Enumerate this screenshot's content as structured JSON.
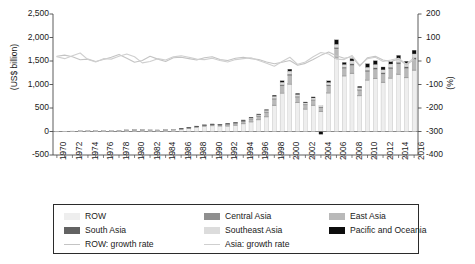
{
  "chart_data": {
    "type": "bar",
    "title": "",
    "subtitle": "",
    "xlabel": "",
    "ylabel": "(US$ billion)",
    "ylabel_right": "(%)",
    "ylim": [
      -500,
      2500
    ],
    "ylim_right": [
      -400,
      200
    ],
    "yticks": [
      "2,500",
      "2,000",
      "1,500",
      "1,000",
      "500",
      "0",
      "-500"
    ],
    "ytick_values": [
      2500,
      2000,
      1500,
      1000,
      500,
      0,
      -500
    ],
    "yticks_right": [
      "200",
      "100",
      "0",
      "-100",
      "-200",
      "-300",
      "-400"
    ],
    "ytick_values_right": [
      200,
      100,
      0,
      -100,
      -200,
      -300,
      -400
    ],
    "grid": false,
    "legend_position": "below",
    "bar_mode": "stacked",
    "x": [
      1970,
      1971,
      1972,
      1973,
      1974,
      1975,
      1976,
      1977,
      1978,
      1979,
      1980,
      1981,
      1982,
      1983,
      1984,
      1985,
      1986,
      1987,
      1988,
      1989,
      1990,
      1991,
      1992,
      1993,
      1994,
      1995,
      1996,
      1997,
      1998,
      1999,
      2000,
      2001,
      2002,
      2003,
      2004,
      2005,
      2006,
      2007,
      2008,
      2009,
      2010,
      2011,
      2012,
      2013,
      2014,
      2015,
      2016
    ],
    "xtick_labels": [
      "1970",
      "1972",
      "1974",
      "1976",
      "1978",
      "1980",
      "1982",
      "1984",
      "1986",
      "1988",
      "1990",
      "1992",
      "1994",
      "1996",
      "1998",
      "2000",
      "2002",
      "2004",
      "2006",
      "2008",
      "2010",
      "2012",
      "2014",
      "2016"
    ],
    "series": [
      {
        "name": "ROW",
        "color": "#eeeeee",
        "values": [
          6,
          7,
          9,
          12,
          14,
          15,
          17,
          19,
          22,
          27,
          30,
          30,
          27,
          26,
          30,
          36,
          50,
          66,
          86,
          104,
          118,
          113,
          124,
          140,
          172,
          212,
          256,
          318,
          560,
          820,
          1010,
          620,
          480,
          560,
          430,
          820,
          1560,
          1180,
          1230,
          760,
          1090,
          1120,
          1040,
          1130,
          1210,
          1140,
          1300
        ]
      },
      {
        "name": "Central Asia",
        "color": "#8f8f8f",
        "values": [
          0,
          0,
          0,
          0,
          0,
          0,
          0,
          0,
          0,
          0,
          0,
          0,
          0,
          0,
          0,
          0,
          0,
          0,
          0,
          0,
          0,
          0,
          1,
          1,
          2,
          2,
          3,
          4,
          5,
          6,
          7,
          5,
          4,
          6,
          5,
          10,
          18,
          14,
          16,
          10,
          15,
          16,
          14,
          16,
          18,
          16,
          20
        ]
      },
      {
        "name": "East Asia",
        "color": "#b9b9b9",
        "values": [
          1,
          1,
          1,
          2,
          2,
          2,
          3,
          3,
          4,
          5,
          6,
          6,
          5,
          5,
          6,
          8,
          11,
          14,
          19,
          23,
          26,
          25,
          28,
          33,
          42,
          54,
          66,
          84,
          120,
          145,
          175,
          105,
          82,
          96,
          74,
          140,
          180,
          150,
          165,
          105,
          170,
          190,
          170,
          190,
          210,
          190,
          215
        ]
      },
      {
        "name": "South Asia",
        "color": "#636363",
        "values": [
          0,
          0,
          0,
          0,
          0,
          0,
          0,
          0,
          0,
          1,
          1,
          1,
          1,
          1,
          1,
          1,
          2,
          2,
          3,
          4,
          4,
          4,
          5,
          6,
          7,
          9,
          11,
          14,
          19,
          24,
          28,
          17,
          13,
          16,
          12,
          22,
          30,
          25,
          28,
          18,
          28,
          30,
          27,
          30,
          34,
          30,
          35
        ]
      },
      {
        "name": "Southeast Asia",
        "color": "#dcdcdc",
        "values": [
          0,
          0,
          0,
          1,
          1,
          1,
          1,
          1,
          2,
          2,
          2,
          2,
          2,
          2,
          2,
          3,
          4,
          5,
          7,
          9,
          10,
          10,
          11,
          13,
          16,
          20,
          25,
          31,
          44,
          54,
          66,
          40,
          31,
          36,
          28,
          52,
          68,
          56,
          62,
          40,
          64,
          70,
          62,
          70,
          78,
          70,
          80
        ]
      },
      {
        "name": "Pacific and Oceania",
        "color": "#0d0d0d",
        "values": [
          0,
          0,
          0,
          0,
          0,
          0,
          0,
          0,
          0,
          0,
          0,
          0,
          0,
          0,
          0,
          0,
          1,
          1,
          2,
          3,
          3,
          3,
          4,
          5,
          7,
          9,
          12,
          16,
          24,
          31,
          40,
          24,
          18,
          22,
          -60,
          34,
          95,
          45,
          50,
          28,
          75,
          80,
          60,
          62,
          70,
          48,
          80
        ]
      }
    ],
    "line_series": [
      {
        "name": "ROW: growth rate",
        "color": "#c4c4c4",
        "values": [
          20,
          25,
          18,
          5,
          8,
          -2,
          6,
          16,
          28,
          12,
          -5,
          2,
          20,
          8,
          -2,
          14,
          16,
          10,
          4,
          14,
          18,
          6,
          2,
          12,
          16,
          10,
          6,
          -4,
          -12,
          -5,
          2,
          -18,
          -10,
          6,
          24,
          38,
          22,
          12,
          18,
          -22,
          14,
          20,
          4,
          -2,
          8,
          -16,
          6
        ]
      },
      {
        "name": "Asia: growth rate",
        "color": "#cfcfcf",
        "values": [
          18,
          10,
          22,
          34,
          6,
          -4,
          10,
          8,
          20,
          30,
          18,
          -8,
          -2,
          10,
          4,
          18,
          22,
          16,
          8,
          6,
          12,
          2,
          -4,
          6,
          10,
          14,
          2,
          -10,
          -22,
          -2,
          16,
          -14,
          -4,
          18,
          36,
          30,
          8,
          6,
          24,
          -18,
          10,
          16,
          -2,
          4,
          12,
          -14,
          14
        ]
      }
    ]
  },
  "axes": {
    "left_title": "(US$ billion)",
    "right_title": "(%)"
  },
  "legend": {
    "entries": [
      {
        "label": "ROW",
        "type": "swatch",
        "color": "#eeeeee"
      },
      {
        "label": "Central Asia",
        "type": "swatch",
        "color": "#8f8f8f"
      },
      {
        "label": "East Asia",
        "type": "swatch",
        "color": "#b9b9b9"
      },
      {
        "label": "South Asia",
        "type": "swatch",
        "color": "#636363"
      },
      {
        "label": "Southeast Asia",
        "type": "swatch",
        "color": "#dcdcdc"
      },
      {
        "label": "Pacific and Oceania",
        "type": "swatch",
        "color": "#0d0d0d"
      },
      {
        "label": "ROW: growth rate",
        "type": "line",
        "color": "#c4c4c4"
      },
      {
        "label": "Asia: growth rate",
        "type": "line",
        "color": "#cfcfcf"
      }
    ]
  }
}
